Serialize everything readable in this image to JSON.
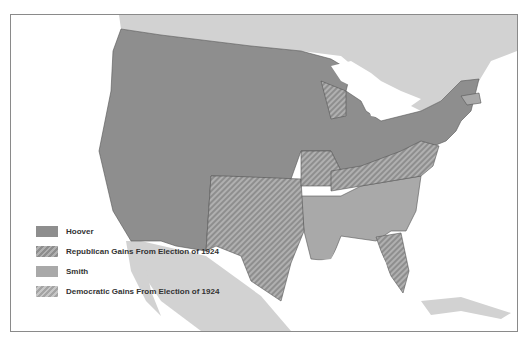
{
  "map": {
    "subject": "Presidential Election of 1928",
    "colors": {
      "hoover": "#8e8e8e",
      "smith": "#a9a9a9",
      "republican_gains_hatch": "#b0b0b0",
      "democratic_gains_hatch": "#c6c6c6",
      "foreign_land": "#d2d2d2",
      "water": "#ffffff",
      "border": "#555555"
    },
    "regions": {
      "hoover": [
        "WA",
        "OR",
        "CA",
        "NV",
        "ID",
        "MT",
        "WY",
        "UT",
        "AZ",
        "CO",
        "NM",
        "ND",
        "SD",
        "NE",
        "KS",
        "OK-part",
        "MN",
        "IA",
        "IL",
        "IN",
        "MI",
        "OH",
        "PA",
        "NY",
        "VT",
        "NH",
        "ME",
        "CT",
        "NJ",
        "DE",
        "MD"
      ],
      "republican_gains": [
        "WI",
        "MO",
        "KY",
        "TN",
        "WV",
        "VA",
        "NC",
        "TX",
        "OK",
        "FL"
      ],
      "smith": [
        "MA",
        "RI",
        "AR",
        "LA",
        "MS",
        "AL",
        "GA",
        "SC"
      ]
    }
  },
  "legend": {
    "items": [
      {
        "key": "hoover",
        "label": "Hoover"
      },
      {
        "key": "rgain",
        "label": "Republican Gains From Election of 1924"
      },
      {
        "key": "smith",
        "label": "Smith"
      },
      {
        "key": "dgain",
        "label": "Democratic Gains From Election of 1924"
      }
    ]
  }
}
